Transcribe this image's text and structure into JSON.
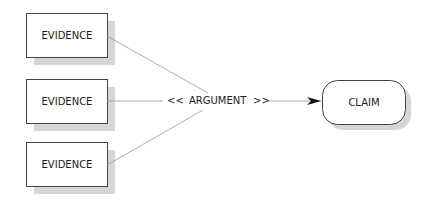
{
  "diagram": {
    "evidence_nodes": [
      {
        "label": "EVIDENCE",
        "x": 26,
        "y": 13,
        "w": 81,
        "h": 44
      },
      {
        "label": "EVIDENCE",
        "x": 26,
        "y": 79,
        "w": 81,
        "h": 44
      },
      {
        "label": "EVIDENCE",
        "x": 26,
        "y": 142,
        "w": 81,
        "h": 44
      }
    ],
    "argument": {
      "left_marker": "<<",
      "label": "ARGUMENT",
      "right_marker": ">>"
    },
    "claim_node": {
      "label": "CLAIM",
      "x": 322,
      "y": 80,
      "w": 83,
      "h": 44
    },
    "colors": {
      "stroke": "#333333",
      "edge": "#888888",
      "shadow": "#d4d4d4",
      "text": "#1a1a1a"
    }
  }
}
